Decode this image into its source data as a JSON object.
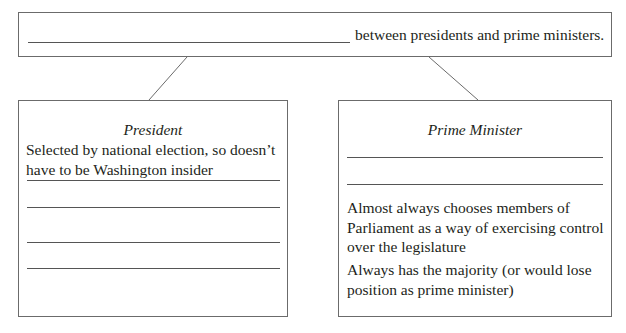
{
  "top": {
    "blank_label": "",
    "text": "between presidents and prime ministers."
  },
  "president": {
    "heading": "President",
    "paragraph": "Selected by national election, so doesn’t have to be Washington insider",
    "blank_lines": [
      "",
      "",
      "",
      ""
    ]
  },
  "prime_minister": {
    "heading": "Prime Minister",
    "blank_lines": [
      "",
      ""
    ],
    "paragraphs": [
      "Almost always chooses members of Parliament as a way of exercising control over the legislature",
      "Always has the majority (or would lose position as prime minister)"
    ]
  }
}
